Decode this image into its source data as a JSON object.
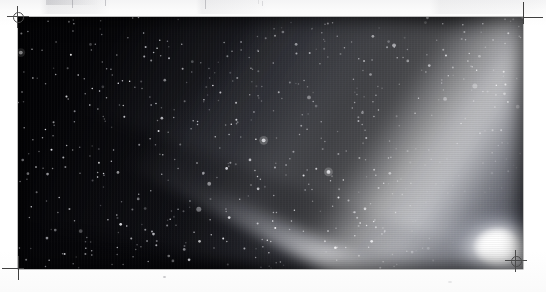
{
  "page": {
    "kind": "scanned-photograph-page",
    "background_color": "#ffffff",
    "width": 546,
    "height": 292
  },
  "photo": {
    "caption": "",
    "subject": "comet",
    "description": "Night sky photograph of a bright comet with a broad fan-shaped dust tail and a narrower ion tail, set against a dense star field",
    "frame": {
      "x": 18,
      "y": 17,
      "width": 505,
      "height": 252
    },
    "sky_color": "#040406",
    "comet_color": "#ffffff",
    "nucleus": {
      "x": 485,
      "y": 232,
      "label": "comet-nucleus"
    },
    "tails": [
      {
        "name": "dust-tail",
        "direction": "upper-left",
        "brightness": "bright"
      },
      {
        "name": "ion-tail",
        "direction": "upper-left",
        "brightness": "medium"
      },
      {
        "name": "lower-dust-streamer",
        "direction": "left",
        "brightness": "faint"
      }
    ]
  },
  "marks": {
    "registration_top_left": {
      "label": "registration-mark",
      "x": 9,
      "y": 8
    },
    "registration_bottom_right": {
      "label": "registration-mark",
      "x": 514,
      "y": 258
    },
    "crop_top_right": {
      "label": "crop-mark",
      "x": 512,
      "y": 6
    },
    "crop_bottom_left": {
      "label": "crop-mark",
      "x": 6,
      "y": 258
    }
  },
  "artifacts": {
    "top_streaks": "faint scanner streaks",
    "dust_speck": "small dark speck below photo"
  }
}
